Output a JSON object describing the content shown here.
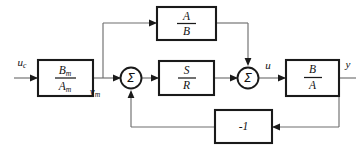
{
  "diagram": {
    "blocks": [
      {
        "id": "model",
        "numerator": "B",
        "numerator_sub": "m",
        "denominator": "A",
        "denominator_sub": "m",
        "label": "Bm/Am"
      },
      {
        "id": "feedforward",
        "numerator": "A",
        "numerator_sub": "",
        "denominator": "B",
        "denominator_sub": "",
        "label": "A/B"
      },
      {
        "id": "controller",
        "numerator": "S",
        "numerator_sub": "",
        "denominator": "R",
        "denominator_sub": "",
        "label": "S/R"
      },
      {
        "id": "plant",
        "numerator": "B",
        "numerator_sub": "",
        "denominator": "A",
        "denominator_sub": "",
        "label": "B/A"
      },
      {
        "id": "feedback-gain",
        "value": "-1",
        "label": "-1"
      }
    ],
    "summing_junctions": [
      {
        "id": "sum-left",
        "symbol": "Σ"
      },
      {
        "id": "sum-right",
        "symbol": "Σ"
      }
    ],
    "signals": [
      {
        "id": "command-input",
        "base": "u",
        "sub": "c"
      },
      {
        "id": "model-output",
        "base": "y",
        "sub": "m"
      },
      {
        "id": "control-input",
        "base": "u",
        "sub": ""
      },
      {
        "id": "plant-output",
        "base": "y",
        "sub": ""
      }
    ],
    "colors": {
      "block_stroke": "#1a1a1a",
      "wire": "#6f6f6f",
      "background": "#ffffff",
      "text": "#111111"
    }
  }
}
